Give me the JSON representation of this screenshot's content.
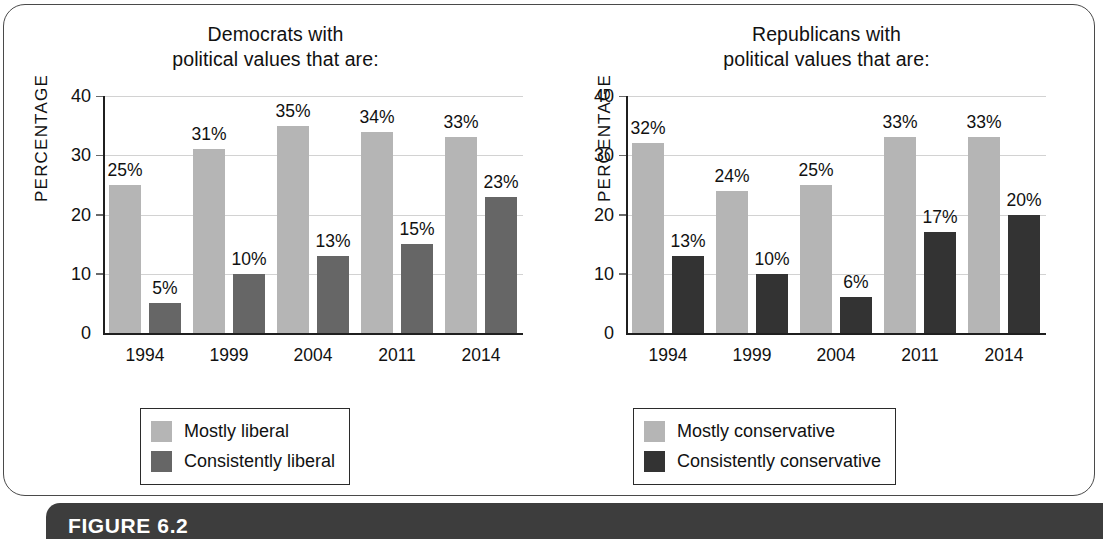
{
  "figure": {
    "caption": "FIGURE 6.2"
  },
  "charts": [
    {
      "id": "democrats",
      "title_line1": "Democrats with",
      "title_line2": "political values that are:",
      "ylabel": "PERCENTAGE",
      "yticks": [
        "0",
        "10",
        "20",
        "30",
        "40"
      ],
      "categories": [
        "1994",
        "1999",
        "2004",
        "2011",
        "2014"
      ],
      "series": [
        {
          "name": "Mostly liberal",
          "color": "#b5b5b5",
          "values": [
            25,
            31,
            35,
            34,
            33
          ],
          "labels": [
            "25%",
            "31%",
            "35%",
            "34%",
            "33%"
          ]
        },
        {
          "name": "Consistently liberal",
          "color": "#666666",
          "values": [
            5,
            10,
            13,
            15,
            23
          ],
          "labels": [
            "5%",
            "10%",
            "13%",
            "15%",
            "23%"
          ]
        }
      ]
    },
    {
      "id": "republicans",
      "title_line1": "Republicans with",
      "title_line2": "political values that are:",
      "ylabel": "PERCENTAGE",
      "yticks": [
        "0",
        "10",
        "20",
        "30",
        "40"
      ],
      "categories": [
        "1994",
        "1999",
        "2004",
        "2011",
        "2014"
      ],
      "series": [
        {
          "name": "Mostly conservative",
          "color": "#b5b5b5",
          "values": [
            32,
            24,
            25,
            33,
            33
          ],
          "labels": [
            "32%",
            "24%",
            "25%",
            "33%",
            "33%"
          ]
        },
        {
          "name": "Consistently conservative",
          "color": "#333333",
          "values": [
            13,
            10,
            6,
            17,
            20
          ],
          "labels": [
            "13%",
            "10%",
            "6%",
            "17%",
            "20%"
          ]
        }
      ]
    }
  ],
  "chart_data": [
    {
      "type": "bar",
      "title": "Democrats with political values that are:",
      "xlabel": "",
      "ylabel": "PERCENTAGE",
      "ylim": [
        0,
        40
      ],
      "yticks": [
        0,
        10,
        20,
        30,
        40
      ],
      "grid": true,
      "legend_position": "bottom-center",
      "categories": [
        "1994",
        "1999",
        "2004",
        "2011",
        "2014"
      ],
      "series": [
        {
          "name": "Mostly liberal",
          "values": [
            25,
            31,
            35,
            34,
            33
          ]
        },
        {
          "name": "Consistently liberal",
          "values": [
            5,
            10,
            13,
            15,
            23
          ]
        }
      ]
    },
    {
      "type": "bar",
      "title": "Republicans with political values that are:",
      "xlabel": "",
      "ylabel": "PERCENTAGE",
      "ylim": [
        0,
        40
      ],
      "yticks": [
        0,
        10,
        20,
        30,
        40
      ],
      "grid": true,
      "legend_position": "bottom-center",
      "categories": [
        "1994",
        "1999",
        "2004",
        "2011",
        "2014"
      ],
      "series": [
        {
          "name": "Mostly conservative",
          "values": [
            32,
            24,
            25,
            33,
            33
          ]
        },
        {
          "name": "Consistently conservative",
          "values": [
            13,
            10,
            6,
            17,
            20
          ]
        }
      ]
    }
  ]
}
